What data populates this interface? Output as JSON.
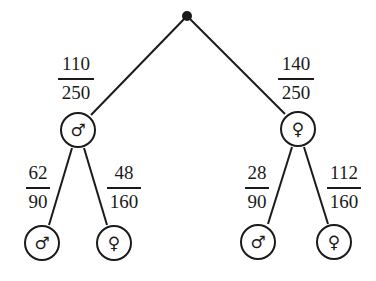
{
  "diagram": {
    "type": "probability-tree",
    "root": {
      "label": ""
    },
    "level1": [
      {
        "symbol": "♂",
        "meaning": "male",
        "prob_num": "110",
        "prob_den": "250"
      },
      {
        "symbol": "♀",
        "meaning": "female",
        "prob_num": "140",
        "prob_den": "250"
      }
    ],
    "level2": [
      {
        "symbol": "♂",
        "meaning": "male",
        "prob_num": "62",
        "prob_den": "90"
      },
      {
        "symbol": "♀",
        "meaning": "female",
        "prob_num": "48",
        "prob_den": "160"
      },
      {
        "symbol": "♂",
        "meaning": "male",
        "prob_num": "28",
        "prob_den": "90"
      },
      {
        "symbol": "♀",
        "meaning": "female",
        "prob_num": "112",
        "prob_den": "160"
      }
    ],
    "colors": {
      "ink": "#1a1a1a",
      "background": "#ffffff"
    }
  }
}
